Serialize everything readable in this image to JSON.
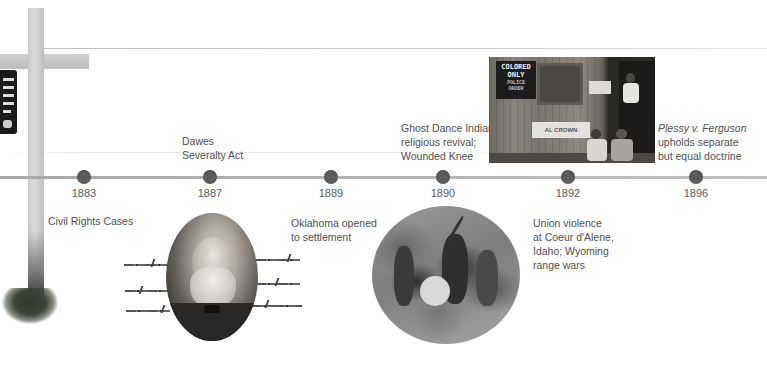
{
  "timeline": {
    "line_color": "#b0b0b0",
    "dot_color": "#5c5c5c",
    "events": [
      {
        "year": "1883",
        "label": "Civil Rights Cases",
        "position": "below"
      },
      {
        "year": "1887",
        "label_lines": [
          "Dawes",
          "Severalty Act"
        ],
        "position": "above"
      },
      {
        "year": "1889",
        "label_lines": [
          "Oklahoma opened",
          "to settlement"
        ],
        "position": "below"
      },
      {
        "year": "1890",
        "label_lines": [
          "Ghost Dance Indian",
          "religious revival;",
          "Wounded Knee"
        ],
        "position": "above"
      },
      {
        "year": "1892",
        "label_lines": [
          "Union violence",
          "at Coeur d'Alene,",
          "Idaho; Wyoming",
          "range wars"
        ],
        "position": "below"
      },
      {
        "year": "1896",
        "label_italic": "Plessy v. Ferguson",
        "label_lines": [
          "upholds separate",
          "but equal doctrine"
        ],
        "position": "above"
      }
    ]
  },
  "images": {
    "fence_post": {
      "description": "barbed-wire fence post with sign"
    },
    "portrait": {
      "description": "oval portrait of bearded man flanked by barbed wire"
    },
    "ghost_dance": {
      "description": "circular illustration of Ghost Dance"
    },
    "segregation_photo": {
      "description": "photo of building with segregation signs and men sitting",
      "sign_text_lines": [
        "COLORED",
        "ONLY",
        "POLICE",
        "ORDER"
      ],
      "banner_text": "AL CROWN"
    }
  }
}
